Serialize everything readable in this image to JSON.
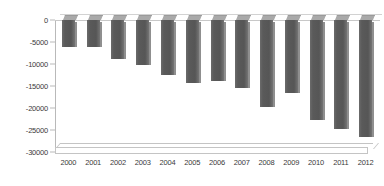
{
  "chart_data": {
    "type": "bar",
    "title": "",
    "subtitle": "",
    "xlabel": "",
    "ylabel": "",
    "categories": [
      "2000",
      "2001",
      "2002",
      "2003",
      "2004",
      "2005",
      "2006",
      "2007",
      "2008",
      "2009",
      "2010",
      "2011",
      "2012"
    ],
    "values": [
      -6200,
      -6200,
      -8800,
      -10200,
      -12500,
      -14400,
      -13900,
      -15500,
      -19700,
      -16600,
      -22700,
      -24800,
      -26500
    ],
    "series": [
      {
        "name": "Series 1",
        "values": [
          -6200,
          -6200,
          -8800,
          -10200,
          -12500,
          -14400,
          -13900,
          -15500,
          -19700,
          -16600,
          -22700,
          -24800,
          -26500
        ]
      }
    ],
    "ylim": [
      -30000,
      0
    ],
    "ytick_values": [
      0,
      -5000,
      -10000,
      -15000,
      -20000,
      -25000,
      -30000
    ],
    "ytick_labels": [
      "0",
      "-5000",
      "-10000",
      "-15000",
      "-20000",
      "-25000",
      "-30000"
    ],
    "grid": false,
    "legend": false,
    "legend_position": "none",
    "style": "3d-column",
    "bar_color": "#5c5c5c",
    "axis_color": "#b9b9b9",
    "background_color": "#ffffff"
  }
}
